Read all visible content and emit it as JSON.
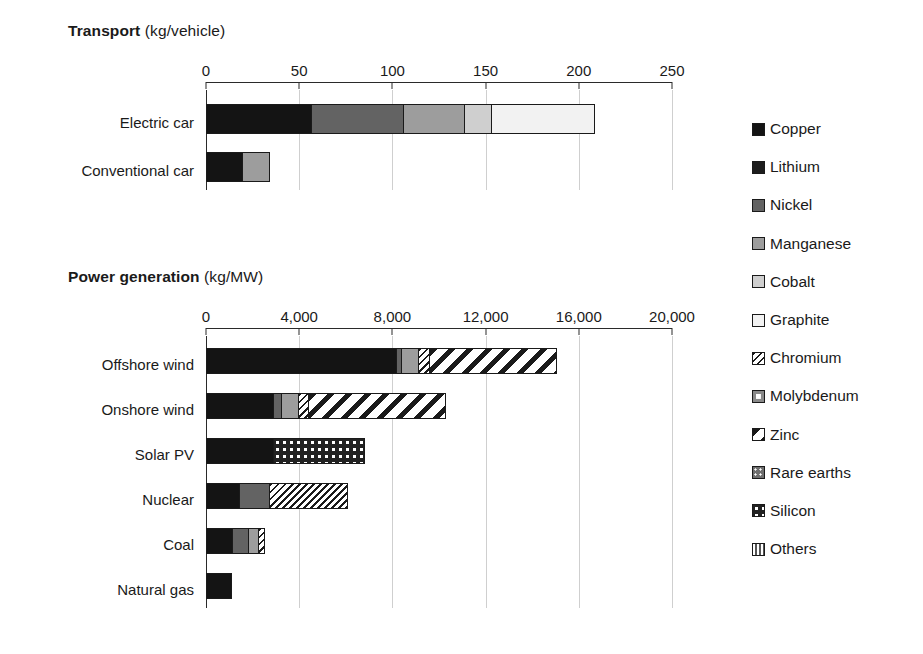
{
  "chart_data": {
    "type": "bar",
    "orientation": "horizontal",
    "stacked": true,
    "grid": true,
    "legend_position": "right",
    "legend": [
      {
        "name": "Copper",
        "pattern": "solid-black"
      },
      {
        "name": "Lithium",
        "pattern": "solid-black"
      },
      {
        "name": "Nickel",
        "pattern": "dark-gray"
      },
      {
        "name": "Manganese",
        "pattern": "mid-gray"
      },
      {
        "name": "Cobalt",
        "pattern": "light-gray"
      },
      {
        "name": "Graphite",
        "pattern": "white"
      },
      {
        "name": "Chromium",
        "pattern": "fine-diagonal-hatch"
      },
      {
        "name": "Molybdenum",
        "pattern": "gray-center-square"
      },
      {
        "name": "Zinc",
        "pattern": "wide-diagonal-hatch"
      },
      {
        "name": "Rare earths",
        "pattern": "gray-dotted"
      },
      {
        "name": "Silicon",
        "pattern": "dark-dotted"
      },
      {
        "name": "Others",
        "pattern": "vertical-lines"
      }
    ],
    "panels": [
      {
        "id": "transport",
        "title": "Transport",
        "unit": "(kg/vehicle)",
        "xlabel": "",
        "ticks": [
          0,
          50,
          100,
          150,
          200,
          250
        ],
        "tick_labels": [
          "0",
          "50",
          "100",
          "150",
          "200",
          "250"
        ],
        "xlim": [
          0,
          250
        ],
        "categories": [
          "Electric car",
          "Conventional car"
        ],
        "series": [
          {
            "name": "Copper",
            "values": [
              57,
              20
            ]
          },
          {
            "name": "Nickel",
            "values": [
              50,
              0
            ]
          },
          {
            "name": "Manganese",
            "values": [
              33,
              15
            ]
          },
          {
            "name": "Cobalt",
            "values": [
              15,
              0
            ]
          },
          {
            "name": "Graphite",
            "values": [
              56,
              0
            ]
          }
        ],
        "totals": [
          211,
          35
        ]
      },
      {
        "id": "power-generation",
        "title": "Power generation",
        "unit": "(kg/MW)",
        "xlabel": "",
        "ticks": [
          0,
          4000,
          8000,
          12000,
          16000,
          20000
        ],
        "tick_labels": [
          "0",
          "4,000",
          "8,000",
          "12,000",
          "16,000",
          "20,000"
        ],
        "xlim": [
          0,
          20000
        ],
        "categories": [
          "Offshore wind",
          "Onshore wind",
          "Solar PV",
          "Nuclear",
          "Coal",
          "Natural gas"
        ],
        "series": [
          {
            "name": "Copper",
            "values": [
              8200,
              2900,
              2900,
              1470,
              1150,
              1100
            ]
          },
          {
            "name": "Nickel",
            "values": [
              240,
              404,
              0,
              1300,
              720,
              0
            ]
          },
          {
            "name": "Manganese",
            "values": [
              790,
              780,
              0,
              0,
              480,
              0
            ]
          },
          {
            "name": "Chromium",
            "values": [
              525,
              470,
              0,
              3430,
              310,
              0
            ]
          },
          {
            "name": "Zinc",
            "values": [
              5500,
              5900,
              0,
              0,
              0,
              0
            ]
          },
          {
            "name": "Silicon",
            "values": [
              0,
              0,
              3950,
              0,
              0,
              0
            ]
          }
        ],
        "totals": [
          15255,
          10454,
          6850,
          6200,
          2660,
          1100
        ]
      }
    ]
  },
  "colors": {
    "axis": "#2a2a2a",
    "gridline": "#cfcfcf",
    "bar_outline": "#1a1a1a",
    "copper": "#141414",
    "nickel": "#636363",
    "manganese": "#9d9d9d",
    "cobalt": "#cfcfcf",
    "graphite": "#f2f2f2"
  }
}
